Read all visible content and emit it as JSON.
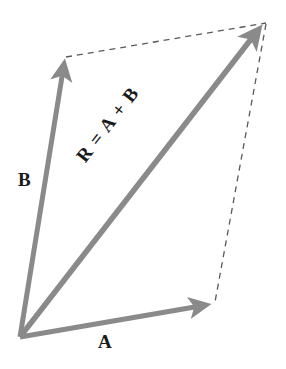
{
  "figure": {
    "background_color": "#ffffff",
    "width": 286,
    "height": 369
  },
  "style": {
    "vector_color": "#8a8a8a",
    "dashed_color": "#5a5a5a",
    "label_color": "#1a1a1a",
    "vector_stroke_width": 5,
    "dashed_stroke_width": 1.3,
    "dash_pattern": "6 5"
  },
  "geometry": {
    "origin": {
      "x": 20,
      "y": 337
    },
    "tip_a": {
      "x": 212,
      "y": 304
    },
    "tip_b": {
      "x": 65,
      "y": 58
    },
    "tip_r": {
      "x": 262,
      "y": 25
    },
    "corner_top_right": {
      "x": 266,
      "y": 23
    },
    "corner_bottom_right": {
      "x": 215,
      "y": 302
    }
  },
  "vectors": [
    {
      "id": "a",
      "label": "A",
      "description": "vector-a",
      "from": {
        "x": 20,
        "y": 337
      },
      "to": {
        "x": 212,
        "y": 304
      }
    },
    {
      "id": "b",
      "label": "B",
      "description": "vector-b",
      "from": {
        "x": 20,
        "y": 337
      },
      "to": {
        "x": 65,
        "y": 58
      }
    },
    {
      "id": "r",
      "label": "R = A + B",
      "description": "resultant-vector",
      "from": {
        "x": 20,
        "y": 337
      },
      "to": {
        "x": 262,
        "y": 25
      }
    }
  ],
  "construction_lines": [
    {
      "id": "dash-top",
      "description": "dashed-line-from-b-tip-to-parallelogram-corner",
      "from": {
        "x": 66,
        "y": 57
      },
      "to": {
        "x": 266,
        "y": 23
      }
    },
    {
      "id": "dash-right",
      "description": "dashed-line-from-parallelogram-corner-to-a-tip",
      "from": {
        "x": 266,
        "y": 24
      },
      "to": {
        "x": 215,
        "y": 302
      }
    }
  ],
  "labels": {
    "a": "A",
    "b": "B",
    "r": "R = A + B"
  },
  "chart_data": {
    "type": "diagram",
    "series": [
      {
        "name": "A",
        "dx": 192,
        "dy": -33
      },
      {
        "name": "B",
        "dx": 45,
        "dy": -279
      },
      {
        "name": "R = A + B",
        "dx": 242,
        "dy": -312
      }
    ]
  }
}
